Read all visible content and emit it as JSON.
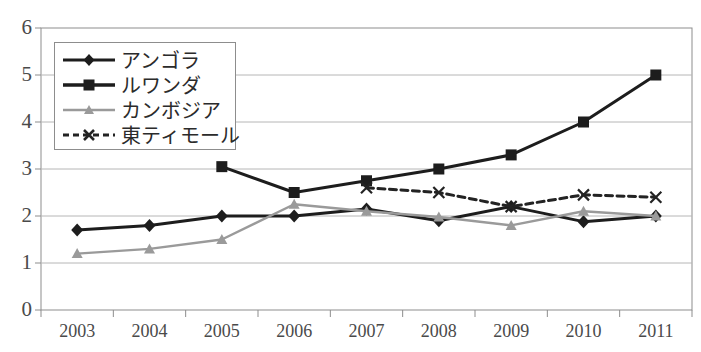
{
  "chart_data": {
    "type": "line",
    "title": "",
    "xlabel": "",
    "ylabel": "",
    "categories": [
      "2003",
      "2004",
      "2005",
      "2006",
      "2007",
      "2008",
      "2009",
      "2010",
      "2011"
    ],
    "ylim": [
      0,
      6
    ],
    "ytick_labels": [
      "0",
      "1",
      "2",
      "3",
      "4",
      "5",
      "6"
    ],
    "ytick_values": [
      0,
      1,
      2,
      3,
      4,
      5,
      6
    ],
    "grid": true,
    "grid_axis": "y",
    "legend_position": "upper-left-inside",
    "series": [
      {
        "name": "アンゴラ",
        "marker": "diamond",
        "line_style": "solid",
        "color": "#1d1d1d",
        "values": [
          1.7,
          1.8,
          2.0,
          2.0,
          2.15,
          1.9,
          2.2,
          1.88,
          2.0
        ]
      },
      {
        "name": "ルワンダ",
        "marker": "square",
        "line_style": "solid",
        "color": "#1d1d1d",
        "values": [
          null,
          null,
          3.05,
          2.5,
          2.75,
          3.0,
          3.3,
          4.0,
          5.0
        ]
      },
      {
        "name": "カンボジア",
        "marker": "triangle",
        "line_style": "solid",
        "color": "#9a9a9a",
        "values": [
          1.2,
          1.3,
          1.5,
          2.25,
          2.1,
          1.98,
          1.8,
          2.1,
          2.0
        ]
      },
      {
        "name": "東ティモール",
        "marker": "cross",
        "line_style": "dashed",
        "color": "#232323",
        "values": [
          null,
          null,
          null,
          null,
          2.6,
          2.5,
          2.2,
          2.45,
          2.4
        ]
      }
    ]
  },
  "legend": {
    "entries": [
      {
        "label": "アンゴラ"
      },
      {
        "label": "ルワンダ"
      },
      {
        "label": "カンボジア"
      },
      {
        "label": "東ティモール"
      }
    ]
  }
}
